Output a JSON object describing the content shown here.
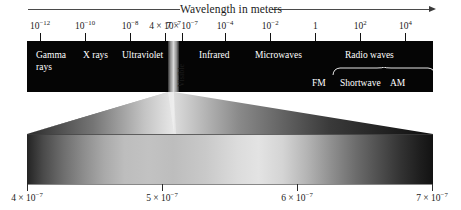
{
  "figure": {
    "title": "Wavelength in meters",
    "type": "electromagnetic-spectrum-diagram"
  },
  "top_axis": {
    "ticks": [
      {
        "label_mantissa": "10",
        "label_exponent": "−12",
        "text": "10⁻¹²",
        "x_pct": 3.2
      },
      {
        "label_mantissa": "10",
        "label_exponent": "−10",
        "text": "10⁻¹⁰",
        "x_pct": 14.3
      },
      {
        "label_mantissa": "10",
        "label_exponent": "−8",
        "text": "10⁻⁸",
        "x_pct": 25.4
      },
      {
        "label_mantissa": "4 × 10",
        "label_exponent": "−7",
        "text": "4 × 10⁻⁷",
        "x_pct": 34.0
      },
      {
        "label_mantissa": "7 × 10",
        "label_exponent": "−7",
        "text": "7 × 10⁻⁷",
        "x_pct": 38.2
      },
      {
        "label_mantissa": "10",
        "label_exponent": "−4",
        "text": "10⁻⁴",
        "x_pct": 48.8
      },
      {
        "label_mantissa": "10",
        "label_exponent": "−2",
        "text": "10⁻²",
        "x_pct": 59.9
      },
      {
        "label_mantissa": "1",
        "label_exponent": "",
        "text": "1",
        "x_pct": 71.0
      },
      {
        "label_mantissa": "10",
        "label_exponent": "2",
        "text": "10²",
        "x_pct": 82.1
      },
      {
        "label_mantissa": "10",
        "label_exponent": "4",
        "text": "10⁴",
        "x_pct": 93.2
      }
    ]
  },
  "bands": [
    {
      "name": "gamma-rays",
      "label": "Gamma rays",
      "x_px": 9,
      "y_px": 9,
      "two_line": true
    },
    {
      "name": "x-rays",
      "label": "X rays",
      "x_px": 56,
      "y_px": 9,
      "two_line": false
    },
    {
      "name": "ultraviolet",
      "label": "Ultraviolet",
      "x_px": 95,
      "y_px": 9,
      "two_line": false
    },
    {
      "name": "visible",
      "label": "Visible",
      "x_px": 141,
      "y_px": 8,
      "vertical": true
    },
    {
      "name": "infrared",
      "label": "Infrared",
      "x_px": 172,
      "y_px": 9,
      "two_line": false
    },
    {
      "name": "microwaves",
      "label": "Microwaves",
      "x_px": 228,
      "y_px": 9,
      "two_line": false
    },
    {
      "name": "radio-waves",
      "label": "Radio waves",
      "x_px": 318,
      "y_px": 9,
      "two_line": false
    }
  ],
  "radio_subbands": [
    {
      "name": "fm",
      "label": "FM",
      "x_px": 312
    },
    {
      "name": "shortwave",
      "label": "Shortwave",
      "x_px": 340
    },
    {
      "name": "am",
      "label": "AM",
      "x_px": 390
    }
  ],
  "bottom_axis": {
    "ticks": [
      {
        "label_mantissa": "4 × 10",
        "label_exponent": "−7",
        "text": "4 × 10⁻⁷",
        "x_px": 27
      },
      {
        "label_mantissa": "5 × 10",
        "label_exponent": "−7",
        "text": "5 × 10⁻⁷",
        "x_px": 162
      },
      {
        "label_mantissa": "6 × 10",
        "label_exponent": "−7",
        "text": "6 × 10⁻⁷",
        "x_px": 297
      },
      {
        "label_mantissa": "7 × 10",
        "label_exponent": "−7",
        "text": "7 × 10⁻⁷",
        "x_px": 432
      }
    ]
  },
  "colors": {
    "band_background": "#050505",
    "band_text": "#ffffff",
    "axis_text": "#1a1a1a",
    "tick": "#111111",
    "page_background": "#ffffff"
  }
}
